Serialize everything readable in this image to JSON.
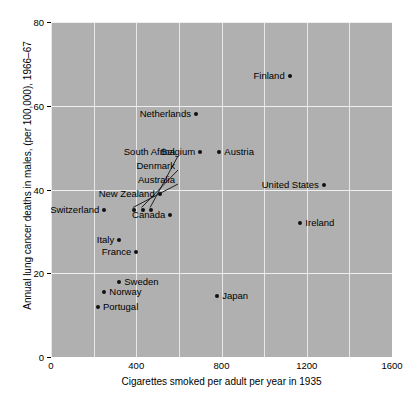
{
  "chart_data": {
    "type": "scatter",
    "title": "",
    "xlabel": "Cigarettes smoked per adult per year in 1935",
    "ylabel": "Annual lung cancer deaths in males, (per 100,000), 1966–67",
    "xlim": [
      0,
      1600
    ],
    "ylim": [
      0,
      80
    ],
    "xticks": [
      "0",
      "400",
      "800",
      "1200",
      "1600"
    ],
    "xtick_values": [
      0,
      400,
      800,
      1200,
      1600
    ],
    "yticks": [
      "0",
      "20",
      "40",
      "60",
      "80"
    ],
    "ytick_values": [
      0,
      20,
      40,
      60,
      80
    ],
    "grid": "major and minor gridlines every 200 on x, every 20 on y",
    "grid_x_step": 200,
    "grid_y_step": 20,
    "panel_background": "#b0b0b0",
    "gridline_color": "#e8e8e8",
    "point_color": "#111111",
    "legend": "none",
    "points": [
      {
        "label": "Great Britain",
        "x": 1570,
        "y": 81,
        "side": "right",
        "leader": false
      },
      {
        "label": "Finland",
        "x": 1120,
        "y": 67,
        "side": "right",
        "leader": false
      },
      {
        "label": "Netherlands",
        "x": 680,
        "y": 58,
        "side": "right",
        "leader": false
      },
      {
        "label": "Belgium",
        "x": 700,
        "y": 49,
        "side": "right",
        "leader": false
      },
      {
        "label": "Austria",
        "x": 790,
        "y": 49,
        "side": "left",
        "leader": false
      },
      {
        "label": "United States",
        "x": 1280,
        "y": 41,
        "side": "right",
        "leader": false
      },
      {
        "label": "Ireland",
        "x": 1170,
        "y": 32,
        "side": "left",
        "leader": false
      },
      {
        "label": "New Zealand",
        "x": 510,
        "y": 39,
        "side": "right",
        "leader": false
      },
      {
        "label": "Canada",
        "x": 560,
        "y": 34,
        "side": "right",
        "leader": false
      },
      {
        "label": "Switzerland",
        "x": 250,
        "y": 35,
        "side": "right",
        "leader": false
      },
      {
        "label": "Australia",
        "x": 390,
        "y": 35,
        "side": "right",
        "leader": true
      },
      {
        "label": "Denmark",
        "x": 430,
        "y": 35,
        "side": "right",
        "leader": true
      },
      {
        "label": "South Africa",
        "x": 470,
        "y": 35,
        "side": "right",
        "leader": true
      },
      {
        "label": "Italy",
        "x": 320,
        "y": 28,
        "side": "right",
        "leader": false
      },
      {
        "label": "France",
        "x": 400,
        "y": 25,
        "side": "right",
        "leader": false
      },
      {
        "label": "Sweden",
        "x": 320,
        "y": 18,
        "side": "left",
        "leader": false
      },
      {
        "label": "Norway",
        "x": 250,
        "y": 15.5,
        "side": "left",
        "leader": false
      },
      {
        "label": "Japan",
        "x": 780,
        "y": 14.5,
        "side": "left",
        "leader": false
      },
      {
        "label": "Portugal",
        "x": 220,
        "y": 12,
        "side": "left",
        "leader": false
      }
    ],
    "leader_labels": [
      {
        "text": "South Africa",
        "label_x": 175,
        "label_y": 152
      },
      {
        "text": "Denmark",
        "label_x": 175,
        "label_y": 166
      },
      {
        "text": "Australia",
        "label_x": 175,
        "label_y": 180
      }
    ]
  }
}
